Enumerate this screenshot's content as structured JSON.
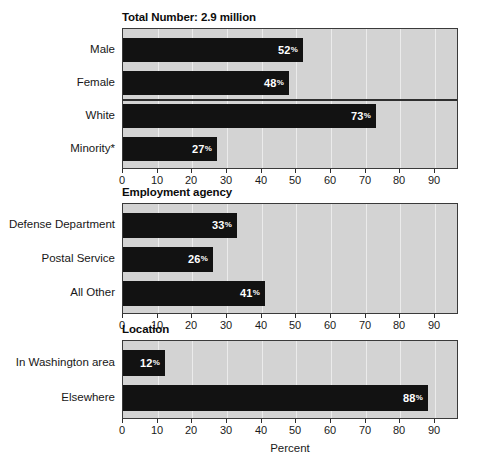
{
  "chart_data": {
    "type": "bar",
    "orientation": "horizontal",
    "title": "",
    "xlabel": "Percent",
    "ylabel": "",
    "xlim": [
      0,
      97
    ],
    "xticks": [
      0,
      10,
      20,
      30,
      40,
      50,
      60,
      70,
      80,
      90
    ],
    "xtick_labels": [
      "0",
      "10",
      "20",
      "30",
      "40",
      "50",
      "60",
      "70",
      "80",
      "90"
    ],
    "grid": true,
    "legend": "none",
    "value_suffix": "%",
    "colors": {
      "bar": "#121212",
      "plot_background": "#d3d3d3",
      "page_background": "#ffffff",
      "axis": "#2e2e2e",
      "gridline": "#ffffff",
      "value_label": "#ffffff",
      "text": "#171717"
    },
    "panels": [
      {
        "title": "Total Number: 2.9 million",
        "separator_after_index": 1,
        "categories": [
          "Male",
          "Female",
          "White",
          "Minority*"
        ],
        "values": [
          52,
          48,
          73,
          27
        ],
        "value_labels": [
          "52%",
          "48%",
          "73%",
          "27%"
        ]
      },
      {
        "title": "Employment agency",
        "separator_after_index": null,
        "categories": [
          "Defense Department",
          "Postal Service",
          "All Other"
        ],
        "values": [
          33,
          26,
          41
        ],
        "value_labels": [
          "33%",
          "26%",
          "41%"
        ]
      },
      {
        "title": "Location",
        "separator_after_index": null,
        "categories": [
          "In Washington area",
          "Elsewhere"
        ],
        "values": [
          12,
          88
        ],
        "value_labels": [
          "12%",
          "88%"
        ]
      }
    ]
  }
}
